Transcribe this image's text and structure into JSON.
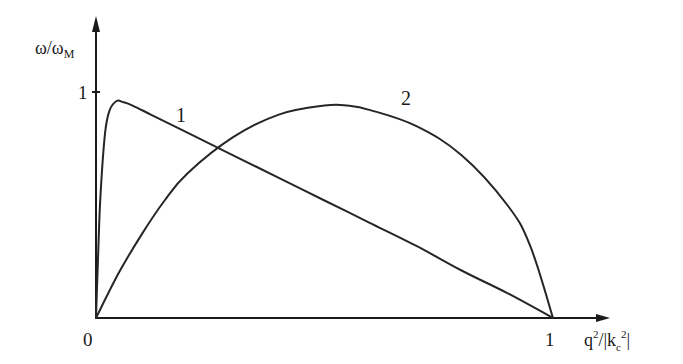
{
  "chart_data": {
    "type": "line",
    "title": "",
    "xlabel": "q²/|k_c²|",
    "ylabel": "ω/ω_M",
    "xlim": [
      0,
      1.1
    ],
    "ylim": [
      0,
      1.3
    ],
    "grid": false,
    "legend": "inline curve labels",
    "x_ticks": [
      {
        "value": 0,
        "label": "0"
      },
      {
        "value": 1,
        "label": "1"
      }
    ],
    "y_ticks": [
      {
        "value": 1,
        "label": "1"
      }
    ],
    "series": [
      {
        "name": "1",
        "x": [
          0,
          0.005,
          0.01,
          0.02,
          0.03,
          0.045,
          0.06,
          0.08,
          0.12,
          0.2,
          0.3,
          0.4,
          0.5,
          0.6,
          0.7,
          0.8,
          0.9,
          1.0
        ],
        "y": [
          0,
          0.3,
          0.55,
          0.82,
          0.92,
          0.96,
          0.955,
          0.94,
          0.9,
          0.82,
          0.72,
          0.62,
          0.52,
          0.42,
          0.32,
          0.21,
          0.11,
          0
        ]
      },
      {
        "name": "2",
        "x": [
          0,
          0.05,
          0.1,
          0.15,
          0.2,
          0.3,
          0.4,
          0.5,
          0.55,
          0.6,
          0.7,
          0.8,
          0.9,
          0.95,
          1.0
        ],
        "y": [
          0,
          0.2,
          0.37,
          0.52,
          0.64,
          0.8,
          0.9,
          0.94,
          0.94,
          0.92,
          0.85,
          0.72,
          0.5,
          0.32,
          0
        ]
      }
    ],
    "annotations": [
      {
        "text": "1",
        "x": 0.2,
        "y": 0.86,
        "refers_to": "curve 1"
      },
      {
        "text": "2",
        "x": 0.68,
        "y": 1.0,
        "refers_to": "curve 2"
      }
    ]
  },
  "labels": {
    "y_axis": {
      "main": "ω/ω",
      "sub": "M"
    },
    "x_axis": {
      "q": "q",
      "q_sup": "2",
      "slash": "/|k",
      "k_sub": "c",
      "k_sup": "2",
      "bar": "|"
    },
    "origin": "0",
    "x_tick_1": "1",
    "y_tick_1": "1",
    "curve1_label": "1",
    "curve2_label": "2"
  }
}
